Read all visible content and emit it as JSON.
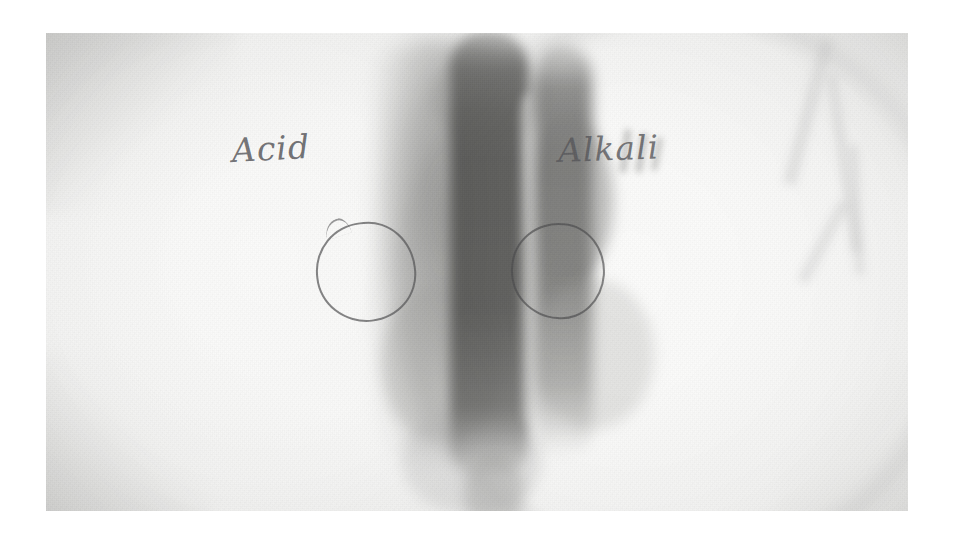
{
  "image": {
    "kind": "photograph-of-radiograph",
    "subject": "x-ray film with handwritten test-side annotations",
    "frame": {
      "background_color": "#ffffff",
      "photo_left": 46,
      "photo_top": 33,
      "photo_width": 862,
      "photo_height": 478
    }
  },
  "annotations": {
    "label_left": "Acid",
    "label_right": "Alkali",
    "pencil_color": "#4e4e52",
    "markers": [
      {
        "name": "circle-acid-side",
        "shape": "hand-drawn-circle",
        "side": "left"
      },
      {
        "name": "circle-alkali-side",
        "shape": "hand-drawn-circle",
        "side": "right"
      }
    ]
  },
  "film": {
    "base_tone": "#f4f4f3",
    "bright_disc_tone": "#fbfbfa",
    "mid_tone": "#c8c8c6",
    "dark_band_tone": "#6e6e6e",
    "darkest_tone": "#5a5a58",
    "regions": [
      {
        "name": "bright-disc-left",
        "tone": "#f8f8f7"
      },
      {
        "name": "bright-disc-right",
        "tone": "#f9f9f8"
      },
      {
        "name": "dark-band-soft-left",
        "tone": "#808080"
      },
      {
        "name": "dark-band-main",
        "tone": "#58585 6"
      },
      {
        "name": "dark-band-secondary",
        "tone": "#646462"
      },
      {
        "name": "corner-wedge-top-left",
        "tone": "#969694"
      },
      {
        "name": "corner-wedge-bottom-left",
        "tone": "#969694"
      },
      {
        "name": "corner-wedge-bottom-right",
        "tone": "#a8a8a6"
      },
      {
        "name": "light-streaks-top-right",
        "tone": "#c4c4c2"
      }
    ]
  }
}
